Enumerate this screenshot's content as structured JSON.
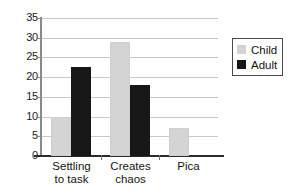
{
  "chart_data": {
    "type": "bar",
    "title": "",
    "xlabel": "",
    "ylabel": "",
    "ylim": [
      0,
      35
    ],
    "ytick_step": 5,
    "yticks": [
      35,
      30,
      25,
      20,
      15,
      10,
      5,
      0
    ],
    "grid": true,
    "legend_position": "right",
    "categories": [
      "Settling to task",
      "Creates chaos",
      "Pica"
    ],
    "category_lines": [
      [
        "Settling",
        "to task"
      ],
      [
        "Creates",
        "chaos"
      ],
      [
        "Pica",
        ""
      ]
    ],
    "series": [
      {
        "name": "Child",
        "color": "#d4d4d4",
        "values": [
          10,
          29,
          7
        ]
      },
      {
        "name": "Adult",
        "color": "#171717",
        "values": [
          22.5,
          18,
          0
        ]
      }
    ]
  },
  "legend": {
    "items": [
      {
        "label": "Child",
        "swatch": "child-swatch"
      },
      {
        "label": "Adult",
        "swatch": "adult-swatch"
      }
    ]
  },
  "axes": {
    "y_tick_labels": [
      "35",
      "30",
      "25",
      "20",
      "15",
      "10",
      "5",
      "0"
    ]
  },
  "colors": {
    "child": "#d4d4d4",
    "adult": "#171717",
    "gridline": "#c9c9c9",
    "axis": "#2b2b2b",
    "background": "#ffffff"
  }
}
